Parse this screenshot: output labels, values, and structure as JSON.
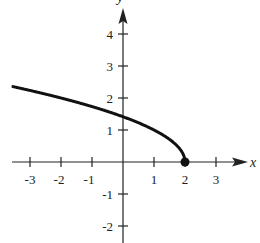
{
  "chart_data": {
    "type": "line",
    "title": "",
    "xlabel": "x",
    "ylabel": "y",
    "function": "y = sqrt(2 - x)",
    "xlim": [
      -3.5,
      4
    ],
    "ylim": [
      -2.5,
      5
    ],
    "x_ticks": [
      "-3",
      "-2",
      "-1",
      "1",
      "2",
      "3"
    ],
    "y_ticks": [
      "4",
      "3",
      "2",
      "1",
      "-1",
      "-2"
    ],
    "grid": false,
    "series": [
      {
        "name": "curve",
        "x": [
          -3.5,
          -3,
          -2,
          -1,
          0,
          1,
          1.5,
          1.9,
          2
        ],
        "y": [
          2.35,
          2.24,
          2.0,
          1.73,
          1.41,
          1.0,
          0.71,
          0.32,
          0
        ]
      }
    ],
    "annotations": [
      {
        "type": "closed-point",
        "x": 2,
        "y": 0
      }
    ]
  }
}
